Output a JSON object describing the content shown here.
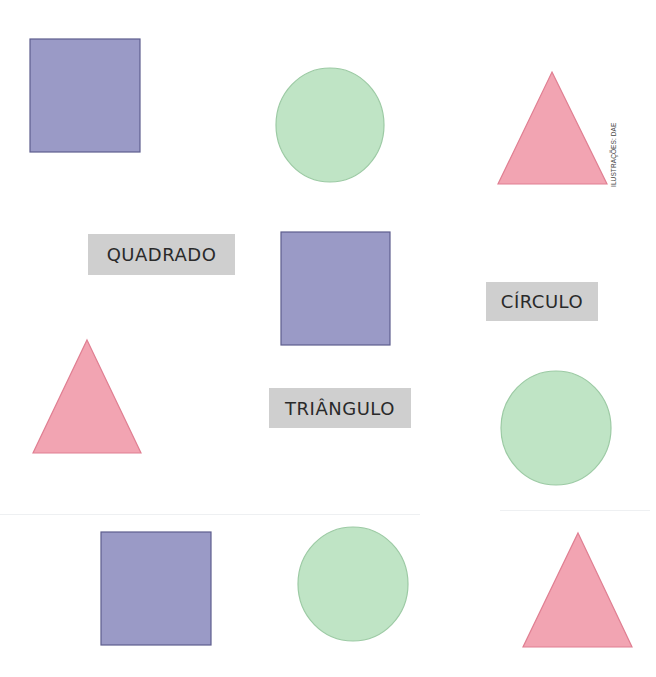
{
  "colors": {
    "square_fill": "#9a9ac6",
    "square_stroke": "#5e5e8e",
    "circle_fill": "#bfe4c5",
    "circle_stroke": "#9ccaa4",
    "triangle_fill": "#f2a4b2",
    "triangle_stroke": "#e07f92",
    "label_bg": "#cfcfcf",
    "label_text": "#2a2a2a"
  },
  "labels": {
    "quadrado": "QUADRADO",
    "circulo": "CÍRCULO",
    "triangulo": "TRIÂNGULO"
  },
  "credit": "ILUSTRAÇÕES: DAE",
  "shapes": [
    {
      "type": "square",
      "x": 30,
      "y": 39,
      "w": 110,
      "h": 113
    },
    {
      "type": "circle",
      "cx": 330,
      "cy": 125,
      "rx": 54,
      "ry": 57
    },
    {
      "type": "triangle",
      "points": "552,72 607,184 498,184"
    },
    {
      "type": "square",
      "x": 281,
      "y": 232,
      "w": 109,
      "h": 113
    },
    {
      "type": "triangle",
      "points": "87,340 141,453 33,453"
    },
    {
      "type": "circle",
      "cx": 556,
      "cy": 428,
      "rx": 55,
      "ry": 57
    },
    {
      "type": "square",
      "x": 101,
      "y": 532,
      "w": 110,
      "h": 113
    },
    {
      "type": "circle",
      "cx": 353,
      "cy": 584,
      "rx": 55,
      "ry": 57
    },
    {
      "type": "triangle",
      "points": "578,533 632,647 523,647"
    }
  ]
}
